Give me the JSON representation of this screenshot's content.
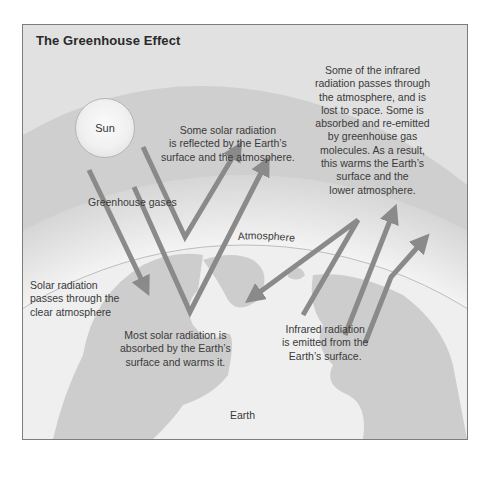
{
  "diagram": {
    "title": "The Greenhouse Effect",
    "sun_label": "Sun",
    "labels": {
      "reflected": [
        "Some solar radiation",
        "is reflected by the Earth’s",
        "surface and the atmosphere."
      ],
      "infrared_escape": [
        "Some of the infrared",
        "radiation passes through",
        "the atmosphere, and is",
        "lost to space. Some is",
        "absorbed and re-emitted",
        "by greenhouse gas",
        "molecules. As a result,",
        "this warms the Earth’s",
        "surface and the",
        "lower atmosphere."
      ],
      "greenhouse_gases": "Greenhouse gases",
      "atmosphere": "Atmosphere",
      "solar_passes": [
        "Solar radiation",
        "passes through the",
        "clear atmosphere"
      ],
      "absorbed": [
        "Most solar radiation is",
        "absorbed by the Earth’s",
        "surface and warms it."
      ],
      "infrared_emitted": [
        "Infrared radiation",
        "is emitted from the",
        "Earth’s surface."
      ],
      "earth": "Earth"
    },
    "colors": {
      "background": "#dcdcdc",
      "atmosphere_band": "#cfcfcf",
      "earth_ocean": "#efefef",
      "land": "#cdcdcd",
      "arrow": "#8a8a8a",
      "text": "#3a3a3a",
      "border": "#7d7d7d"
    }
  }
}
